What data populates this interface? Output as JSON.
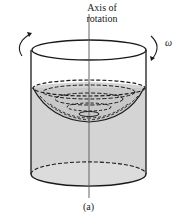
{
  "figure": {
    "axis_label_line1": "Axis of",
    "axis_label_line2": "rotation",
    "omega": "ω",
    "caption": "(a)"
  },
  "colors": {
    "liquid": "#d4d4d4",
    "stroke": "#1a1a1a",
    "background": "#ffffff"
  }
}
